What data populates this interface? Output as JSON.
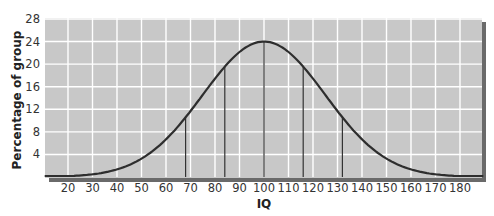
{
  "chart_data": {
    "type": "line",
    "title": "",
    "xlabel": "IQ",
    "ylabel": "Percentage of group",
    "xlim": [
      10,
      190
    ],
    "ylim": [
      0,
      28
    ],
    "x_ticks": [
      20,
      30,
      40,
      50,
      60,
      70,
      80,
      90,
      100,
      110,
      120,
      130,
      140,
      150,
      160,
      170,
      180
    ],
    "y_ticks": [
      4,
      8,
      12,
      16,
      20,
      24,
      28
    ],
    "grid": true,
    "legend": null,
    "series": [
      {
        "name": "IQ distribution (normal curve)",
        "x": [
          10,
          20,
          30,
          40,
          50,
          60,
          68,
          70,
          80,
          84,
          90,
          100,
          110,
          116,
          120,
          130,
          132,
          140,
          150,
          160,
          170,
          180,
          190
        ],
        "values": [
          0.2,
          0.5,
          1.1,
          2.3,
          4.1,
          6.9,
          10.5,
          11.0,
          17.7,
          19.5,
          22.1,
          24.0,
          22.1,
          19.5,
          17.7,
          11.0,
          10.5,
          6.9,
          4.1,
          2.3,
          1.1,
          0.5,
          0.2
        ]
      }
    ],
    "annotations": [
      {
        "type": "vertical-line",
        "x": 68,
        "to_curve": true
      },
      {
        "type": "vertical-line",
        "x": 84,
        "to_curve": true
      },
      {
        "type": "vertical-line",
        "x": 100,
        "to_curve": true
      },
      {
        "type": "vertical-line",
        "x": 116,
        "to_curve": true
      },
      {
        "type": "vertical-line",
        "x": 132,
        "to_curve": true
      }
    ],
    "curve_params": {
      "mean": 100,
      "peak": 24,
      "display_sigma": 25
    },
    "colors": {
      "plot_bg": "#c8c8c8",
      "grid": "#ffffff",
      "curve": "#2e2e2e",
      "shadow": "#6a6a6a"
    }
  }
}
